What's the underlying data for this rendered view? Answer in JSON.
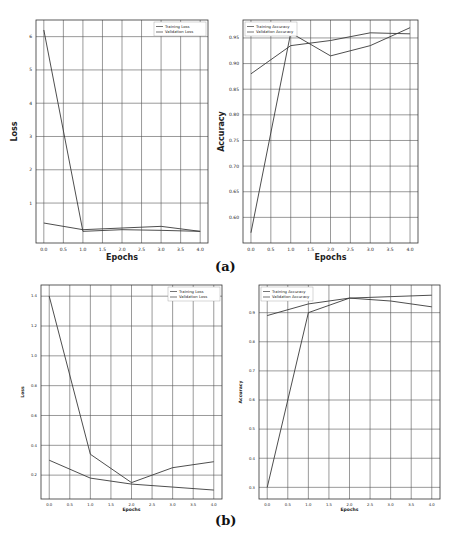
{
  "figure": {
    "labels": [
      "(a)",
      "(b)"
    ]
  },
  "chart_data": [
    {
      "id": "a-loss",
      "type": "line",
      "panel": "(a)",
      "title": "",
      "xlabel": "Epochs",
      "ylabel": "Loss",
      "x": [
        0,
        1,
        2,
        3,
        4
      ],
      "xticks": [
        "0.0",
        "0.5",
        "1.0",
        "1.5",
        "2.0",
        "2.5",
        "3.0",
        "3.5",
        "4.0"
      ],
      "yticks": [
        "1",
        "2",
        "3",
        "4",
        "5",
        "6"
      ],
      "ytick_values": [
        1,
        2,
        3,
        4,
        5,
        6
      ],
      "ylim": [
        -0.2,
        6.5
      ],
      "xlim": [
        -0.2,
        4.2
      ],
      "grid": true,
      "legend_position": "upper right",
      "series": [
        {
          "name": "Training Loss",
          "values": [
            6.2,
            0.15,
            0.2,
            0.18,
            0.15
          ]
        },
        {
          "name": "Validation Loss",
          "values": [
            0.4,
            0.2,
            0.25,
            0.3,
            0.15
          ]
        }
      ]
    },
    {
      "id": "a-acc",
      "type": "line",
      "panel": "(a)",
      "title": "",
      "xlabel": "Epochs",
      "ylabel": "Accuracy",
      "x": [
        0,
        1,
        2,
        3,
        4
      ],
      "xticks": [
        "0.0",
        "0.5",
        "1.0",
        "1.5",
        "2.0",
        "2.5",
        "3.0",
        "3.5",
        "4.0"
      ],
      "yticks": [
        "0.60",
        "0.65",
        "0.70",
        "0.75",
        "0.80",
        "0.85",
        "0.90",
        "0.95"
      ],
      "ytick_values": [
        0.6,
        0.65,
        0.7,
        0.75,
        0.8,
        0.85,
        0.9,
        0.95
      ],
      "ylim": [
        0.55,
        0.985
      ],
      "xlim": [
        -0.2,
        4.2
      ],
      "grid": true,
      "legend_position": "upper left",
      "series": [
        {
          "name": "Training Accuracy",
          "values": [
            0.57,
            0.96,
            0.915,
            0.935,
            0.97
          ]
        },
        {
          "name": "Validation Accuracy",
          "values": [
            0.88,
            0.935,
            0.945,
            0.96,
            0.958
          ]
        }
      ]
    },
    {
      "id": "b-loss",
      "type": "line",
      "panel": "(b)",
      "title": "",
      "xlabel": "Epochs",
      "ylabel": "Loss",
      "x": [
        0,
        1,
        2,
        3,
        4
      ],
      "xticks": [
        "0.0",
        "0.5",
        "1.0",
        "1.5",
        "2.0",
        "2.5",
        "3.0",
        "3.5",
        "4.0"
      ],
      "yticks": [
        "0.2",
        "0.4",
        "0.6",
        "0.8",
        "1.0",
        "1.2",
        "1.4"
      ],
      "ytick_values": [
        0.2,
        0.4,
        0.6,
        0.8,
        1.0,
        1.2,
        1.4
      ],
      "ylim": [
        0.04,
        1.475
      ],
      "xlim": [
        -0.2,
        4.2
      ],
      "grid": true,
      "legend_position": "upper right",
      "series": [
        {
          "name": "Training Loss",
          "values": [
            1.4,
            0.34,
            0.15,
            0.25,
            0.29
          ]
        },
        {
          "name": "Validation Loss",
          "values": [
            0.3,
            0.18,
            0.14,
            0.12,
            0.1
          ]
        }
      ]
    },
    {
      "id": "b-acc",
      "type": "line",
      "panel": "(b)",
      "title": "",
      "xlabel": "Epochs",
      "ylabel": "Accuracy",
      "x": [
        0,
        1,
        2,
        3,
        4
      ],
      "xticks": [
        "0.0",
        "0.5",
        "1.0",
        "1.5",
        "2.0",
        "2.5",
        "3.0",
        "3.5",
        "4.0"
      ],
      "yticks": [
        "0.3",
        "0.4",
        "0.5",
        "0.6",
        "0.7",
        "0.8",
        "0.9"
      ],
      "ytick_values": [
        0.3,
        0.4,
        0.5,
        0.6,
        0.7,
        0.8,
        0.9
      ],
      "ylim": [
        0.26,
        0.995
      ],
      "xlim": [
        -0.2,
        4.2
      ],
      "grid": true,
      "legend_position": "upper left",
      "series": [
        {
          "name": "Training Accuracy",
          "values": [
            0.3,
            0.9,
            0.95,
            0.955,
            0.96
          ]
        },
        {
          "name": "Validation Accuracy",
          "values": [
            0.89,
            0.93,
            0.95,
            0.94,
            0.92
          ]
        }
      ]
    }
  ],
  "layout": {
    "charts": [
      {
        "id": "a-loss",
        "frame": [
          36,
          20,
          208,
          243
        ],
        "fs": 4.5,
        "labelfs": 8
      },
      {
        "id": "a-acc",
        "frame": [
          243,
          20,
          418,
          243
        ],
        "fs": 4.5,
        "labelfs": 8
      },
      {
        "id": "b-loss",
        "frame": [
          41,
          285,
          222,
          499
        ],
        "fs": 3.8,
        "labelfs": 4.5
      },
      {
        "id": "b-acc",
        "frame": [
          259,
          285,
          440,
          499
        ],
        "fs": 3.8,
        "labelfs": 4.5
      }
    ],
    "line_color": "#3a3a3a",
    "grid_color": "#555555"
  }
}
